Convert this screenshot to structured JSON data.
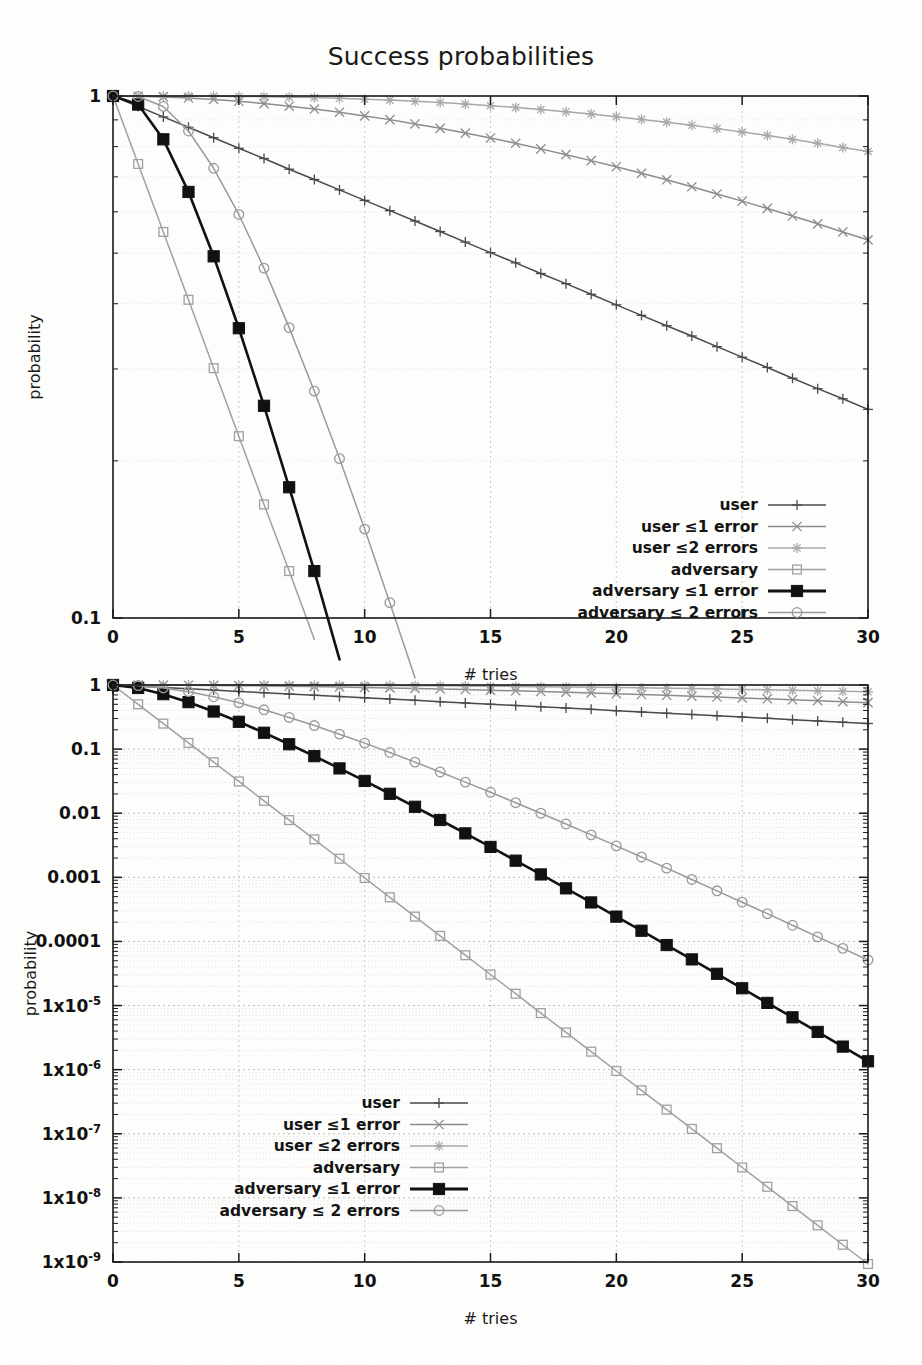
{
  "figure": {
    "title": "Success probabilities",
    "xlabel": "# tries",
    "ylabel": "probability"
  },
  "legend": {
    "entries": [
      {
        "label": "user",
        "marker": "plus",
        "color": "#4a4a4a",
        "lw": 1.6
      },
      {
        "label": "user ≤1 error",
        "marker": "cross",
        "color": "#8c8c8c",
        "lw": 1.5
      },
      {
        "label": "user ≤2 errors",
        "marker": "asterisk",
        "color": "#a8a8a8",
        "lw": 1.5
      },
      {
        "label": "adversary",
        "marker": "open-square",
        "color": "#a0a0a0",
        "lw": 1.4
      },
      {
        "label": "adversary ≤1 error",
        "marker": "filled-square",
        "color": "#111111",
        "lw": 2.8
      },
      {
        "label": "adversary ≤ 2 errors",
        "marker": "open-circle",
        "color": "#9a9a9a",
        "lw": 1.5
      }
    ]
  },
  "axis_ticks": {
    "x": [
      "0",
      "5",
      "10",
      "15",
      "20",
      "25",
      "30"
    ],
    "x_values": [
      0,
      5,
      10,
      15,
      20,
      25,
      30
    ],
    "top_y": [
      "1",
      "0.1"
    ],
    "bottom_y": [
      {
        "text": "1",
        "exp": null
      },
      {
        "text": "0.1",
        "exp": null
      },
      {
        "text": "0.01",
        "exp": null
      },
      {
        "text": "0.001",
        "exp": null
      },
      {
        "text": "0.0001",
        "exp": null
      },
      {
        "text": "1x10",
        "exp": "-5"
      },
      {
        "text": "1x10",
        "exp": "-6"
      },
      {
        "text": "1x10",
        "exp": "-7"
      },
      {
        "text": "1x10",
        "exp": "-8"
      },
      {
        "text": "1x10",
        "exp": "-9"
      }
    ]
  },
  "chart_data": [
    {
      "type": "line",
      "id": "top-panel",
      "title": "Success probabilities",
      "xlabel": "# tries",
      "ylabel": "probability",
      "xlim": [
        0,
        30
      ],
      "ylim": [
        0.1,
        1
      ],
      "yscale": "log",
      "grid": true,
      "legend_position": "bottom-right",
      "x": [
        0,
        1,
        2,
        3,
        4,
        5,
        6,
        7,
        8,
        9,
        10,
        11,
        12,
        13,
        14,
        15,
        16,
        17,
        18,
        19,
        20,
        21,
        22,
        23,
        24,
        25,
        26,
        27,
        28,
        29,
        30
      ],
      "series": [
        {
          "name": "user",
          "marker": "plus",
          "color": "#4a4a4a",
          "values": [
            1,
            0.955,
            0.912,
            0.871,
            0.832,
            0.794,
            0.759,
            0.724,
            0.692,
            0.661,
            0.631,
            0.603,
            0.576,
            0.55,
            0.525,
            0.501,
            0.479,
            0.457,
            0.437,
            0.417,
            0.398,
            0.38,
            0.363,
            0.347,
            0.331,
            0.316,
            0.302,
            0.288,
            0.275,
            0.263,
            0.251
          ]
        },
        {
          "name": "user ≤1 error",
          "marker": "cross",
          "color": "#8c8c8c",
          "values": [
            1,
            0.999,
            0.996,
            0.991,
            0.985,
            0.977,
            0.967,
            0.956,
            0.944,
            0.931,
            0.916,
            0.901,
            0.884,
            0.867,
            0.849,
            0.831,
            0.812,
            0.792,
            0.772,
            0.752,
            0.732,
            0.711,
            0.691,
            0.67,
            0.649,
            0.629,
            0.609,
            0.589,
            0.569,
            0.549,
            0.53
          ]
        },
        {
          "name": "user ≤2 errors",
          "marker": "asterisk",
          "color": "#a8a8a8",
          "values": [
            1,
            1,
            0.9999,
            0.9996,
            0.999,
            0.998,
            0.997,
            0.995,
            0.993,
            0.99,
            0.986,
            0.982,
            0.977,
            0.972,
            0.965,
            0.958,
            0.951,
            0.942,
            0.933,
            0.924,
            0.913,
            0.902,
            0.891,
            0.879,
            0.866,
            0.853,
            0.84,
            0.826,
            0.812,
            0.797,
            0.783
          ]
        },
        {
          "name": "adversary",
          "marker": "open-square",
          "color": "#a0a0a0",
          "values": [
            1,
            0.741,
            0.549,
            0.407,
            0.301,
            0.223,
            0.165,
            0.123,
            0.091,
            0.0672,
            0.0498,
            0.0369,
            0.0273,
            0.0203,
            0.015,
            0.0111,
            0.00824,
            0.0061,
            0.00452,
            0.00335,
            0.00248,
            0.00184,
            0.00136,
            0.00101,
            0.000748,
            0.000554,
            0.000411,
            0.000304,
            0.000226,
            0.000167,
            0.000124
          ]
        },
        {
          "name": "adversary ≤1 error",
          "marker": "filled-square",
          "color": "#111111",
          "values": [
            1,
            0.963,
            0.826,
            0.655,
            0.493,
            0.359,
            0.255,
            0.178,
            0.123,
            0.0833,
            0.0559,
            0.0372,
            0.0246,
            0.0161,
            0.0105,
            0.00682,
            0.0044,
            0.00283,
            0.00181,
            0.00116,
            0.000736,
            0.000467,
            0.000295,
            0.000186,
            0.000117,
            7.37e-05,
            4.62e-05,
            2.9e-05,
            1.81e-05,
            1.13e-05,
            7.07e-06
          ]
        },
        {
          "name": "adversary ≤ 2 errors",
          "marker": "open-circle",
          "color": "#9a9a9a",
          "values": [
            1,
            0.998,
            0.955,
            0.857,
            0.727,
            0.593,
            0.468,
            0.36,
            0.272,
            0.202,
            0.148,
            0.107,
            0.0768,
            0.0546,
            0.0385,
            0.027,
            0.0188,
            0.013,
            0.00895,
            0.00613,
            0.00419,
            0.00285,
            0.00193,
            0.0013,
            0.000878,
            0.000589,
            0.000395,
            0.000264,
            0.000176,
            0.000117,
            7.79e-05
          ]
        }
      ]
    },
    {
      "type": "line",
      "id": "bottom-panel",
      "xlabel": "# tries",
      "ylabel": "probability",
      "xlim": [
        0,
        30
      ],
      "ylim": [
        1e-09,
        1
      ],
      "yscale": "log",
      "grid": true,
      "legend_position": "bottom-left",
      "x": [
        0,
        1,
        2,
        3,
        4,
        5,
        6,
        7,
        8,
        9,
        10,
        11,
        12,
        13,
        14,
        15,
        16,
        17,
        18,
        19,
        20,
        21,
        22,
        23,
        24,
        25,
        26,
        27,
        28,
        29,
        30
      ],
      "series": [
        {
          "name": "user",
          "marker": "plus",
          "color": "#4a4a4a",
          "values": [
            1,
            0.955,
            0.912,
            0.871,
            0.832,
            0.794,
            0.759,
            0.724,
            0.692,
            0.661,
            0.631,
            0.603,
            0.576,
            0.55,
            0.525,
            0.501,
            0.479,
            0.457,
            0.437,
            0.417,
            0.398,
            0.38,
            0.363,
            0.347,
            0.331,
            0.316,
            0.302,
            0.288,
            0.275,
            0.263,
            0.251
          ]
        },
        {
          "name": "user ≤1 error",
          "marker": "cross",
          "color": "#8c8c8c",
          "values": [
            1,
            0.999,
            0.996,
            0.991,
            0.985,
            0.977,
            0.967,
            0.956,
            0.944,
            0.931,
            0.916,
            0.901,
            0.884,
            0.867,
            0.849,
            0.831,
            0.812,
            0.792,
            0.772,
            0.752,
            0.732,
            0.711,
            0.691,
            0.67,
            0.649,
            0.629,
            0.609,
            0.589,
            0.569,
            0.549,
            0.53
          ]
        },
        {
          "name": "user ≤2 errors",
          "marker": "asterisk",
          "color": "#a8a8a8",
          "values": [
            1,
            1,
            0.9999,
            0.9996,
            0.999,
            0.998,
            0.997,
            0.995,
            0.993,
            0.99,
            0.986,
            0.982,
            0.977,
            0.972,
            0.965,
            0.958,
            0.951,
            0.942,
            0.933,
            0.924,
            0.913,
            0.902,
            0.891,
            0.879,
            0.866,
            0.853,
            0.84,
            0.826,
            0.812,
            0.797,
            0.783
          ]
        },
        {
          "name": "adversary",
          "marker": "open-square",
          "color": "#a0a0a0",
          "values": [
            1,
            0.5,
            0.25,
            0.125,
            0.0625,
            0.0313,
            0.0156,
            0.00781,
            0.00391,
            0.00195,
            0.000977,
            0.000488,
            0.000244,
            0.000122,
            6.1e-05,
            3.05e-05,
            1.53e-05,
            7.63e-06,
            3.81e-06,
            1.91e-06,
            9.54e-07,
            4.77e-07,
            2.38e-07,
            1.19e-07,
            5.96e-08,
            2.98e-08,
            1.49e-08,
            7.45e-09,
            3.73e-09,
            1.86e-09,
            9.31e-10
          ]
        },
        {
          "name": "adversary ≤1 error",
          "marker": "filled-square",
          "color": "#111111",
          "values": [
            1,
            0.9,
            0.72,
            0.54,
            0.386,
            0.267,
            0.18,
            0.119,
            0.0776,
            0.05,
            0.0319,
            0.0201,
            0.0126,
            0.00784,
            0.00485,
            0.00298,
            0.00182,
            0.00111,
            0.000673,
            0.000406,
            0.000244,
            0.000147,
            8.79e-05,
            5.25e-05,
            3.13e-05,
            1.86e-05,
            1.1e-05,
            6.55e-06,
            3.88e-06,
            2.29e-06,
            1.35e-06
          ]
        },
        {
          "name": "adversary ≤ 2 errors",
          "marker": "open-circle",
          "color": "#9a9a9a",
          "values": [
            1,
            0.98,
            0.9,
            0.787,
            0.656,
            0.527,
            0.41,
            0.312,
            0.233,
            0.171,
            0.124,
            0.0886,
            0.0627,
            0.044,
            0.0306,
            0.0212,
            0.0146,
            0.01,
            0.00679,
            0.00459,
            0.00309,
            0.00208,
            0.00139,
            0.000926,
            0.000616,
            0.000409,
            0.000271,
            0.000179,
            0.000118,
            7.8e-05,
            5.14e-05
          ]
        }
      ]
    }
  ]
}
